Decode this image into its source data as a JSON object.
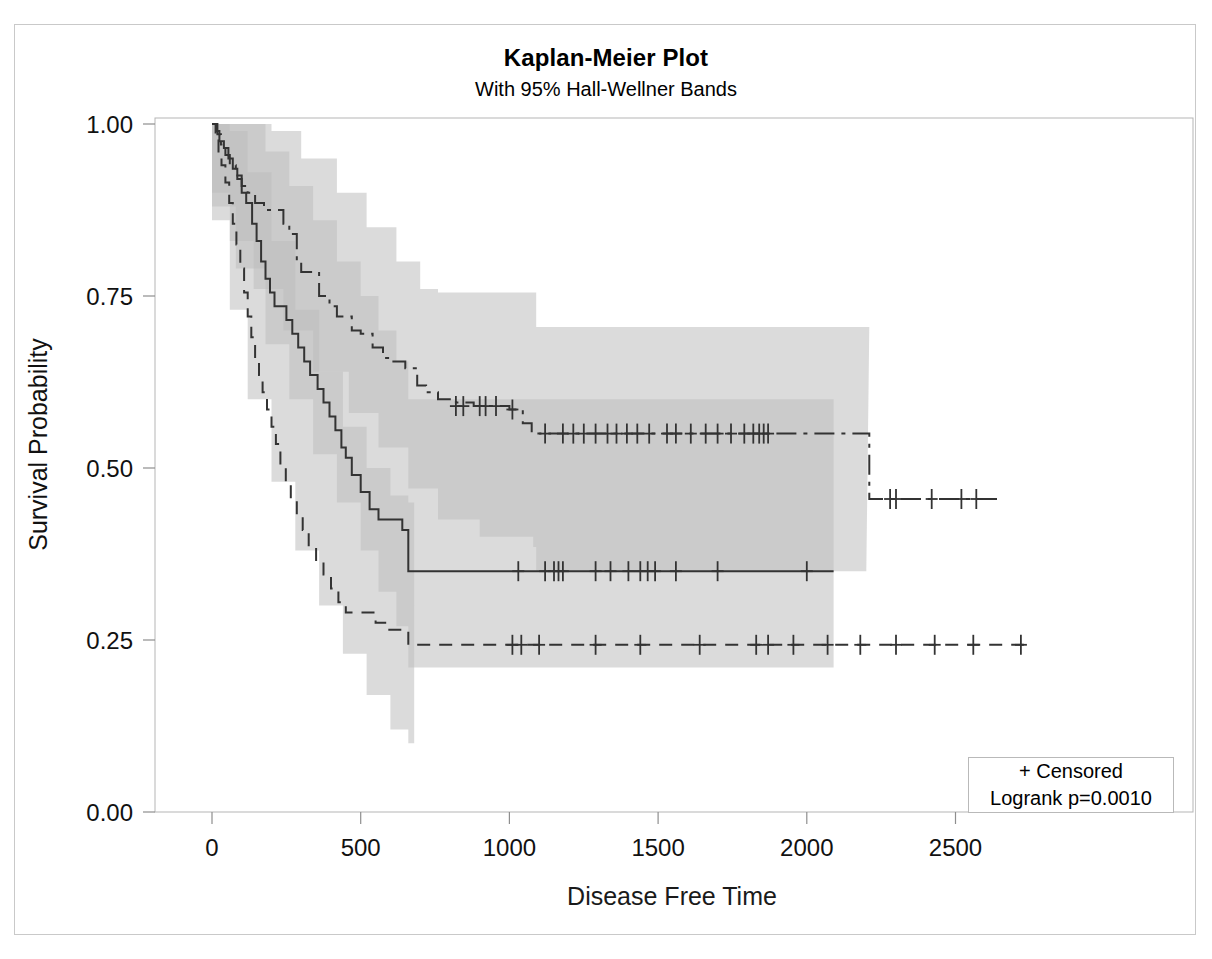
{
  "chart_data": {
    "type": "line",
    "title": "Kaplan-Meier Plot",
    "subtitle": "With 95% Hall-Wellner Bands",
    "xlabel": "Disease Free Time",
    "ylabel": "Survival Probability",
    "xlim": [
      -120,
      2760
    ],
    "ylim": [
      0.0,
      1.045
    ],
    "xticks": [
      0,
      500,
      1000,
      1500,
      2000,
      2500
    ],
    "xticklabels": [
      "0",
      "500",
      "1000",
      "1500",
      "2000",
      "2500"
    ],
    "yticks": [
      0.0,
      0.25,
      0.5,
      0.75,
      1.0
    ],
    "yticklabels": [
      "0.00",
      "0.25",
      "0.50",
      "0.75",
      "1.00"
    ],
    "grid": false,
    "legend": {
      "position": "lower-right",
      "entries": [
        "+ Censored",
        "Logrank p=0.0010"
      ]
    },
    "band_label": "95% Hall-Wellner Bands",
    "band_fill_light": "#d9d9d9",
    "band_fill_dark": "#bdbdbd",
    "line_color": "#333333",
    "series": [
      {
        "name": "upper-group",
        "style": "dash-dot",
        "steps": [
          [
            0,
            1.0
          ],
          [
            18,
            0.985
          ],
          [
            30,
            0.97
          ],
          [
            45,
            0.955
          ],
          [
            60,
            0.94
          ],
          [
            80,
            0.925
          ],
          [
            100,
            0.91
          ],
          [
            120,
            0.9
          ],
          [
            145,
            0.885
          ],
          [
            175,
            0.875
          ],
          [
            215,
            0.875
          ],
          [
            240,
            0.855
          ],
          [
            260,
            0.84
          ],
          [
            285,
            0.8
          ],
          [
            300,
            0.785
          ],
          [
            330,
            0.785
          ],
          [
            360,
            0.75
          ],
          [
            395,
            0.735
          ],
          [
            420,
            0.72
          ],
          [
            450,
            0.72
          ],
          [
            470,
            0.7
          ],
          [
            500,
            0.695
          ],
          [
            540,
            0.675
          ],
          [
            575,
            0.66
          ],
          [
            610,
            0.655
          ],
          [
            650,
            0.645
          ],
          [
            690,
            0.62
          ],
          [
            720,
            0.61
          ],
          [
            760,
            0.6
          ],
          [
            820,
            0.595
          ],
          [
            880,
            0.59
          ],
          [
            950,
            0.59
          ],
          [
            1000,
            0.585
          ],
          [
            1045,
            0.565
          ],
          [
            1075,
            0.55
          ],
          [
            2200,
            0.55
          ],
          [
            2210,
            0.455
          ],
          [
            2640,
            0.455
          ]
        ],
        "censored_times": [
          820,
          845,
          900,
          920,
          955,
          1010,
          1120,
          1180,
          1215,
          1250,
          1290,
          1330,
          1360,
          1395,
          1430,
          1470,
          1530,
          1560,
          1610,
          1660,
          1700,
          1745,
          1790,
          1820,
          1840,
          1855,
          1870,
          2280,
          2300,
          2420,
          2520,
          2570
        ],
        "censored_level": [
          0.59,
          0.59,
          0.59,
          0.59,
          0.59,
          0.585,
          0.55,
          0.55,
          0.55,
          0.55,
          0.55,
          0.55,
          0.55,
          0.55,
          0.55,
          0.55,
          0.55,
          0.55,
          0.55,
          0.55,
          0.55,
          0.55,
          0.55,
          0.55,
          0.55,
          0.55,
          0.55,
          0.455,
          0.455,
          0.455,
          0.455,
          0.455
        ],
        "band_upper": [
          [
            0,
            1.0
          ],
          [
            50,
            1.0
          ],
          [
            120,
            1.0
          ],
          [
            200,
            0.99
          ],
          [
            300,
            0.95
          ],
          [
            420,
            0.9
          ],
          [
            520,
            0.85
          ],
          [
            620,
            0.8
          ],
          [
            700,
            0.76
          ],
          [
            760,
            0.755
          ],
          [
            1080,
            0.755
          ],
          [
            1090,
            0.705
          ],
          [
            2200,
            0.705
          ],
          [
            2210,
            0.705
          ]
        ],
        "band_lower": [
          [
            0,
            0.9
          ],
          [
            60,
            0.83
          ],
          [
            140,
            0.76
          ],
          [
            240,
            0.7
          ],
          [
            340,
            0.64
          ],
          [
            460,
            0.58
          ],
          [
            560,
            0.53
          ],
          [
            660,
            0.47
          ],
          [
            760,
            0.425
          ],
          [
            900,
            0.4
          ],
          [
            1080,
            0.385
          ],
          [
            1090,
            0.35
          ],
          [
            2090,
            0.35
          ],
          [
            2200,
            0.35
          ]
        ]
      },
      {
        "name": "middle-group",
        "style": "solid",
        "steps": [
          [
            0,
            1.0
          ],
          [
            14,
            0.99
          ],
          [
            25,
            0.975
          ],
          [
            40,
            0.965
          ],
          [
            55,
            0.95
          ],
          [
            70,
            0.935
          ],
          [
            85,
            0.92
          ],
          [
            100,
            0.9
          ],
          [
            115,
            0.885
          ],
          [
            135,
            0.855
          ],
          [
            150,
            0.83
          ],
          [
            165,
            0.8
          ],
          [
            180,
            0.775
          ],
          [
            195,
            0.755
          ],
          [
            210,
            0.735
          ],
          [
            230,
            0.735
          ],
          [
            250,
            0.715
          ],
          [
            270,
            0.695
          ],
          [
            290,
            0.675
          ],
          [
            310,
            0.655
          ],
          [
            330,
            0.635
          ],
          [
            355,
            0.615
          ],
          [
            375,
            0.595
          ],
          [
            395,
            0.575
          ],
          [
            415,
            0.555
          ],
          [
            435,
            0.53
          ],
          [
            450,
            0.515
          ],
          [
            470,
            0.49
          ],
          [
            500,
            0.465
          ],
          [
            530,
            0.44
          ],
          [
            560,
            0.425
          ],
          [
            600,
            0.425
          ],
          [
            640,
            0.41
          ],
          [
            660,
            0.35
          ],
          [
            2090,
            0.35
          ]
        ],
        "censored_times": [
          1030,
          1120,
          1150,
          1165,
          1180,
          1290,
          1340,
          1400,
          1440,
          1465,
          1490,
          1560,
          1700,
          2000
        ],
        "censored_level": [
          0.35,
          0.35,
          0.35,
          0.35,
          0.35,
          0.35,
          0.35,
          0.35,
          0.35,
          0.35,
          0.35,
          0.35,
          0.35,
          0.35
        ],
        "band_upper": [
          [
            0,
            1.0
          ],
          [
            80,
            1.0
          ],
          [
            180,
            0.96
          ],
          [
            260,
            0.91
          ],
          [
            340,
            0.86
          ],
          [
            420,
            0.8
          ],
          [
            500,
            0.75
          ],
          [
            560,
            0.7
          ],
          [
            620,
            0.655
          ],
          [
            660,
            0.6
          ],
          [
            2090,
            0.6
          ]
        ],
        "band_lower": [
          [
            0,
            0.88
          ],
          [
            80,
            0.79
          ],
          [
            180,
            0.68
          ],
          [
            260,
            0.6
          ],
          [
            340,
            0.52
          ],
          [
            420,
            0.45
          ],
          [
            500,
            0.38
          ],
          [
            560,
            0.32
          ],
          [
            620,
            0.27
          ],
          [
            660,
            0.21
          ],
          [
            2090,
            0.21
          ]
        ]
      },
      {
        "name": "lower-group",
        "style": "dashed",
        "steps": [
          [
            0,
            1.0
          ],
          [
            12,
            0.98
          ],
          [
            22,
            0.96
          ],
          [
            32,
            0.94
          ],
          [
            45,
            0.915
          ],
          [
            58,
            0.885
          ],
          [
            70,
            0.855
          ],
          [
            82,
            0.825
          ],
          [
            95,
            0.79
          ],
          [
            108,
            0.755
          ],
          [
            120,
            0.72
          ],
          [
            132,
            0.69
          ],
          [
            145,
            0.66
          ],
          [
            158,
            0.635
          ],
          [
            170,
            0.61
          ],
          [
            185,
            0.585
          ],
          [
            200,
            0.56
          ],
          [
            215,
            0.535
          ],
          [
            230,
            0.505
          ],
          [
            248,
            0.48
          ],
          [
            265,
            0.455
          ],
          [
            285,
            0.43
          ],
          [
            305,
            0.41
          ],
          [
            325,
            0.385
          ],
          [
            350,
            0.365
          ],
          [
            375,
            0.345
          ],
          [
            400,
            0.325
          ],
          [
            425,
            0.305
          ],
          [
            450,
            0.29
          ],
          [
            510,
            0.29
          ],
          [
            550,
            0.275
          ],
          [
            590,
            0.265
          ],
          [
            640,
            0.265
          ],
          [
            660,
            0.243
          ],
          [
            2730,
            0.243
          ]
        ],
        "censored_times": [
          1010,
          1040,
          1100,
          1290,
          1440,
          1640,
          1830,
          1870,
          1955,
          2070,
          2180,
          2300,
          2430,
          2560,
          2720
        ],
        "censored_level": [
          0.243,
          0.243,
          0.243,
          0.243,
          0.243,
          0.243,
          0.243,
          0.243,
          0.243,
          0.243,
          0.243,
          0.243,
          0.243,
          0.243,
          0.243
        ],
        "band_upper": [
          [
            0,
            1.0
          ],
          [
            60,
            0.99
          ],
          [
            120,
            0.93
          ],
          [
            200,
            0.83
          ],
          [
            280,
            0.73
          ],
          [
            360,
            0.64
          ],
          [
            440,
            0.56
          ],
          [
            520,
            0.5
          ],
          [
            600,
            0.46
          ],
          [
            660,
            0.45
          ],
          [
            680,
            0.45
          ]
        ],
        "band_lower": [
          [
            0,
            0.86
          ],
          [
            60,
            0.73
          ],
          [
            120,
            0.6
          ],
          [
            200,
            0.48
          ],
          [
            280,
            0.38
          ],
          [
            360,
            0.3
          ],
          [
            440,
            0.23
          ],
          [
            520,
            0.17
          ],
          [
            600,
            0.12
          ],
          [
            660,
            0.1
          ],
          [
            680,
            0.1
          ]
        ]
      }
    ]
  },
  "title": "Kaplan-Meier Plot",
  "subtitle": "With 95% Hall-Wellner Bands",
  "axes": {
    "x_title": "Disease Free Time",
    "y_title": "Survival Probability"
  },
  "legend": {
    "censored": "+ Censored",
    "logrank": "Logrank p=0.0010"
  }
}
